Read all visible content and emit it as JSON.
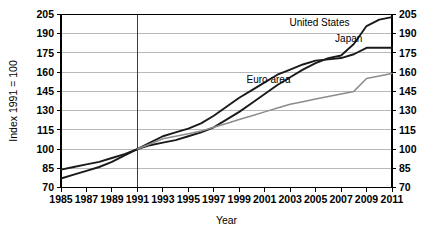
{
  "chart_data": {
    "type": "line",
    "title": "",
    "xlabel": "Year",
    "ylabel": "Index 1991 = 100",
    "xlim": [
      1985,
      2011
    ],
    "ylim": [
      70,
      205
    ],
    "grid": true,
    "legend_position": "inline-annotations",
    "xticks": [
      1985,
      1987,
      1989,
      1991,
      1993,
      1995,
      1997,
      1999,
      2001,
      2003,
      2005,
      2007,
      2009,
      2011
    ],
    "yticks": [
      70,
      85,
      100,
      115,
      130,
      145,
      160,
      175,
      190,
      205
    ],
    "yticks_right": [
      70,
      85,
      100,
      115,
      130,
      145,
      160,
      175,
      190,
      205
    ],
    "reference_line_x": 1991,
    "x": [
      1985,
      1986,
      1987,
      1988,
      1989,
      1990,
      1991,
      1992,
      1993,
      1994,
      1995,
      1996,
      1997,
      1998,
      1999,
      2000,
      2001,
      2002,
      2003,
      2004,
      2005,
      2006,
      2007,
      2008,
      2009,
      2010,
      2011
    ],
    "series": [
      {
        "name": "United States",
        "color": "#1a1a1a",
        "width": 1.9,
        "values": [
          77,
          80,
          83,
          86,
          90,
          95,
          100,
          103,
          105,
          107,
          110,
          113,
          117,
          123,
          129,
          136,
          143,
          150,
          156,
          162,
          167,
          171,
          173,
          182,
          196,
          201,
          203
        ],
        "label_x": 2005.3,
        "label_y": 199
      },
      {
        "name": "Japan",
        "color": "#1a1a1a",
        "width": 1.9,
        "values": [
          84,
          86,
          88,
          90,
          93,
          96,
          100,
          105,
          110,
          113,
          116,
          120,
          126,
          133,
          140,
          146,
          152,
          158,
          162,
          166,
          169,
          170,
          171,
          174,
          179,
          179,
          179
        ],
        "label_x": 2007.6,
        "label_y": 186
      },
      {
        "name": "Euro area",
        "color": "#8c8c8c",
        "width": 1.5,
        "values": [
          null,
          null,
          null,
          null,
          null,
          null,
          100,
          104,
          108,
          110,
          112,
          114,
          117,
          120,
          123,
          126,
          129,
          132,
          135,
          137,
          139,
          141,
          143,
          145,
          155,
          157,
          159
        ],
        "label_x": 2001.3,
        "label_y": 154
      }
    ]
  }
}
